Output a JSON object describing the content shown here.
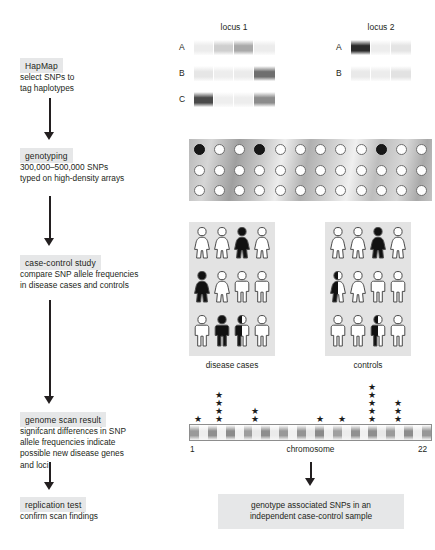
{
  "figure": {
    "background": "#ffffff"
  },
  "flow": {
    "steps": [
      {
        "tag": "HapMap",
        "desc": "select SNPs to\ntag haplotypes"
      },
      {
        "tag": "genotyping",
        "desc": "300,000–500,000 SNPs\ntyped on high-density arrays"
      },
      {
        "tag": "case-control study",
        "desc": "compare SNP allele frequencies\nin disease cases and controls"
      },
      {
        "tag": "genome scan result",
        "desc": "signifcant differences in SNP\nallele frequencies indicate\npossible new disease genes\nand loci"
      },
      {
        "tag": "replication test",
        "desc": "confirm scan findings"
      }
    ],
    "arrow_icon": "down-arrow-icon"
  },
  "haplotypes": {
    "locus1": {
      "title": "locus 1",
      "rows": [
        {
          "label": "A",
          "segments": [
            "#ececec",
            "#cfcfcf",
            "#a9a9a9",
            "#ececec"
          ]
        },
        {
          "label": "B",
          "segments": [
            "#e6e6e6",
            "#ededed",
            "#ebebeb",
            "#6f6f6f"
          ]
        },
        {
          "label": "C",
          "segments": [
            "#4a4a4a",
            "#eeeeee",
            "#ededed",
            "#8c8c8c"
          ]
        }
      ]
    },
    "locus2": {
      "title": "locus 2",
      "rows": [
        {
          "label": "A",
          "segments": [
            "#2b2b2b",
            "#ededed",
            "#e4e4e4"
          ]
        },
        {
          "label": "B",
          "segments": [
            "#e9e9e9",
            "#ececec",
            "#e2e2e2"
          ]
        }
      ]
    }
  },
  "array": {
    "name": "genotyping-array",
    "rows": 3,
    "cols": 12,
    "filled_positions": [
      {
        "row": 0,
        "col": 0
      },
      {
        "row": 0,
        "col": 3
      },
      {
        "row": 0,
        "col": 9
      }
    ]
  },
  "cohorts": [
    {
      "caption": "disease cases",
      "grid": [
        [
          {
            "sex": "female",
            "fill": "white"
          },
          {
            "sex": "female",
            "fill": "white"
          },
          {
            "sex": "female",
            "fill": "black"
          },
          {
            "sex": "female",
            "fill": "white"
          }
        ],
        [
          {
            "sex": "female",
            "fill": "black"
          },
          {
            "sex": "female",
            "fill": "white"
          },
          {
            "sex": "male",
            "fill": "white"
          },
          {
            "sex": "male",
            "fill": "white"
          }
        ],
        [
          {
            "sex": "male",
            "fill": "white"
          },
          {
            "sex": "male",
            "fill": "black"
          },
          {
            "sex": "male",
            "fill": "half"
          },
          {
            "sex": "male",
            "fill": "white"
          }
        ]
      ]
    },
    {
      "caption": "controls",
      "grid": [
        [
          {
            "sex": "female",
            "fill": "white"
          },
          {
            "sex": "female",
            "fill": "white"
          },
          {
            "sex": "female",
            "fill": "black"
          },
          {
            "sex": "female",
            "fill": "white"
          }
        ],
        [
          {
            "sex": "female",
            "fill": "half"
          },
          {
            "sex": "female",
            "fill": "white"
          },
          {
            "sex": "male",
            "fill": "white"
          },
          {
            "sex": "male",
            "fill": "white"
          }
        ],
        [
          {
            "sex": "male",
            "fill": "white"
          },
          {
            "sex": "male",
            "fill": "white"
          },
          {
            "sex": "male",
            "fill": "half"
          },
          {
            "sex": "male",
            "fill": "white"
          }
        ]
      ]
    }
  ],
  "chromosome": {
    "label": "chromosome",
    "start_label": "1",
    "end_label": "22",
    "bands": [
      "#9a9a9a",
      "#ededed",
      "#8f8f8f",
      "#efefef",
      "#8b8b8b",
      "#f0f0f0",
      "#9d9d9d",
      "#e9e9e9",
      "#8d8d8d",
      "#ebebeb",
      "#999999",
      "#f1f1f1",
      "#949494",
      "#e7e7e7",
      "#8a8a8a",
      "#eeeeee",
      "#a0a0a0",
      "#ececec",
      "#909090",
      "#f0f0f0",
      "#8e8e8e",
      "#e8e8e8",
      "#9b9b9b",
      "#efefef",
      "#8c8c8c",
      "#ededed",
      "#979797"
    ],
    "peaks": [
      {
        "x": 198,
        "count": 1
      },
      {
        "x": 219,
        "count": 4
      },
      {
        "x": 255,
        "count": 2
      },
      {
        "x": 320,
        "count": 1
      },
      {
        "x": 342,
        "count": 1
      },
      {
        "x": 372,
        "count": 5
      },
      {
        "x": 398,
        "count": 3
      }
    ],
    "star_glyph": "★"
  },
  "replication": {
    "box_text": "genotype associated SNPs in an\nindependent case-control sample"
  }
}
